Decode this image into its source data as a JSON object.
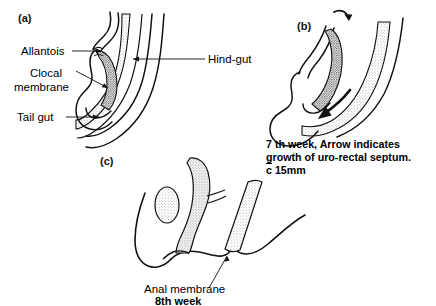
{
  "figure": {
    "background_color": "#ffffff",
    "ink_color": "#000000",
    "shade_light": "#e2e2e2",
    "shade_dark": "#a8a8a8"
  },
  "panels": [
    {
      "id": "a",
      "letter": "(a)",
      "labels": [
        {
          "name": "allantois",
          "text": "Allantois"
        },
        {
          "name": "cloacal-membrane-line1",
          "text": "Clocal"
        },
        {
          "name": "cloacal-membrane-line2",
          "text": "membrane"
        },
        {
          "name": "tail-gut",
          "text": "Tail gut"
        },
        {
          "name": "hind-gut",
          "text": "Hind-gut"
        }
      ]
    },
    {
      "id": "b",
      "letter": "(b)",
      "caption_lines": [
        "7 th week, Arrow indicates",
        "growth of uro-rectal septum."
      ],
      "caption_measure_prefix": "c",
      "caption_measure_value": " 15mm"
    },
    {
      "id": "c",
      "letter": "(c)",
      "labels": [
        {
          "name": "anal-membrane",
          "text": "Anal membrane"
        }
      ],
      "caption_week": "8th week"
    }
  ]
}
